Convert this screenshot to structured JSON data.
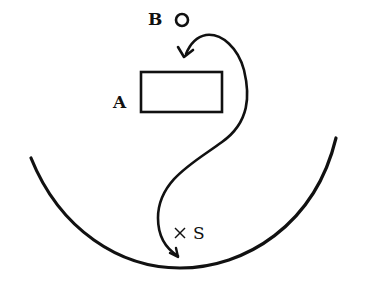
{
  "diagram": {
    "labels": {
      "b": "B",
      "a": "A",
      "s": "S"
    },
    "elements": {
      "point_b": {
        "shape": "small-circle",
        "cx": 182,
        "cy": 20,
        "r": 6
      },
      "box_a": {
        "shape": "rectangle",
        "x": 141,
        "y": 72,
        "width": 81,
        "height": 40
      },
      "point_s": {
        "shape": "cross-marker",
        "cx": 180,
        "cy": 233
      },
      "bowl": {
        "shape": "arc",
        "from": [
          31,
          158
        ],
        "bottom": [
          180,
          268
        ],
        "to": [
          336,
          138
        ]
      },
      "path": {
        "shape": "curved-arrow",
        "from": "near S (arrow tip)",
        "to": "above A (arrow tip)",
        "description": "S-shaped curve from bottom near S, looping right of A, ending with arrowhead pointing down just above A under B"
      }
    },
    "colors": {
      "stroke": "#111111",
      "background": "#ffffff"
    }
  }
}
